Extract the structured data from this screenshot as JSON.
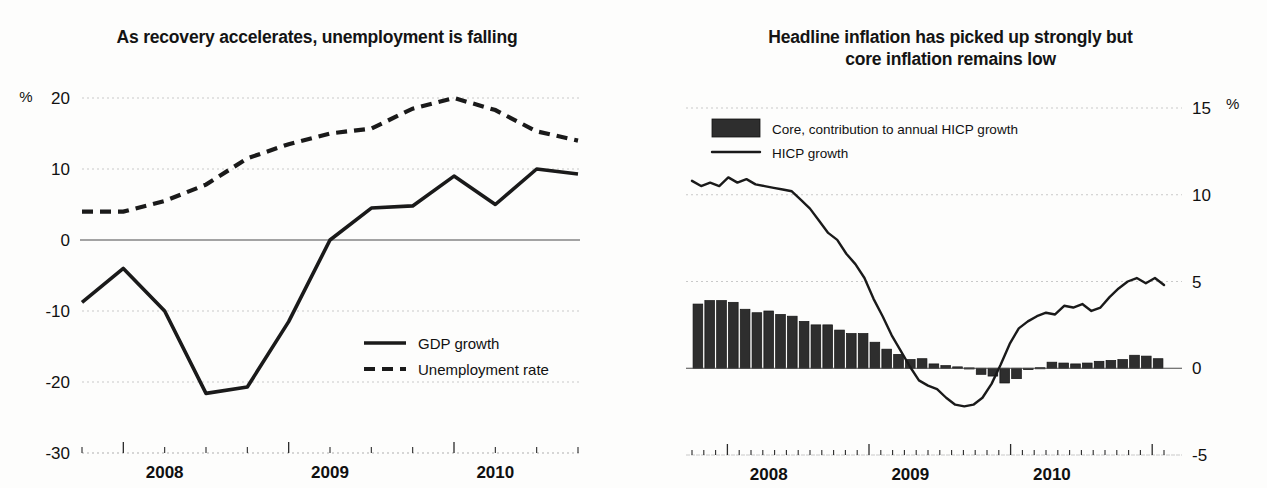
{
  "figure": {
    "background_color": "#fdfdfc",
    "ink_color": "#1a1a1a",
    "bar_color": "#2e2e2e",
    "grid_color": "#c9c9c9"
  },
  "chart_data": [
    {
      "id": "left",
      "type": "line",
      "title": "As recovery accelerates, unemployment is falling",
      "xlabel": "",
      "ylabel": "",
      "unit_label": "%",
      "unit_label_position": "top-left",
      "grid": true,
      "legend_position": "inside-right-lower",
      "ylim": [
        -30,
        20
      ],
      "yticks": [
        20,
        10,
        0,
        -10,
        -20,
        -30
      ],
      "ytick_labels": [
        "20",
        "10",
        "0",
        "-10",
        "-20",
        "-30"
      ],
      "x": [
        "2007Q4",
        "2008Q1",
        "2008Q2",
        "2008Q3",
        "2008Q4",
        "2009Q1",
        "2009Q2",
        "2009Q3",
        "2009Q4",
        "2010Q1",
        "2010Q2",
        "2010Q3",
        "2010Q4"
      ],
      "xtick_labels": [
        "2008",
        "2009",
        "2010"
      ],
      "xtick_label_positions": [
        2,
        6,
        10
      ],
      "series": [
        {
          "name": "GDP growth",
          "style": "solid",
          "values": [
            -8.8,
            -4.0,
            -10.0,
            -21.6,
            -20.7,
            -11.5,
            0.0,
            4.5,
            4.8,
            9.0,
            5.0,
            10.0,
            9.3
          ]
        },
        {
          "name": "Unemployment rate",
          "style": "dashed",
          "values": [
            4.0,
            4.0,
            5.5,
            7.8,
            11.5,
            13.5,
            15.0,
            15.7,
            18.5,
            20.0,
            18.3,
            15.3,
            14.0
          ]
        }
      ]
    },
    {
      "id": "right",
      "type": "bar+line",
      "title": "Headline inflation has picked up strongly but core inflation remains low",
      "xlabel": "",
      "ylabel": "",
      "unit_label": "%",
      "unit_label_position": "top-right",
      "grid": true,
      "y_axis_side": "right",
      "legend_position": "inside-top-left",
      "ylim": [
        -5,
        15
      ],
      "yticks": [
        15,
        10,
        5,
        0,
        -5
      ],
      "ytick_labels": [
        "15",
        "10",
        "5",
        "0",
        "-5"
      ],
      "xtick_labels": [
        "2008",
        "2009",
        "2010"
      ],
      "xtick_label_positions": [
        6,
        18,
        30
      ],
      "x": [
        "2007-10",
        "2007-11",
        "2007-12",
        "2008-01",
        "2008-02",
        "2008-03",
        "2008-04",
        "2008-05",
        "2008-06",
        "2008-07",
        "2008-08",
        "2008-09",
        "2008-10",
        "2008-11",
        "2008-12",
        "2009-01",
        "2009-02",
        "2009-03",
        "2009-04",
        "2009-05",
        "2009-06",
        "2009-07",
        "2009-08",
        "2009-09",
        "2009-10",
        "2009-11",
        "2009-12",
        "2010-01",
        "2010-02",
        "2010-03",
        "2010-04",
        "2010-05",
        "2010-06",
        "2010-07",
        "2010-08",
        "2010-09",
        "2010-10",
        "2010-11",
        "2010-12"
      ],
      "series": [
        {
          "name": "Core, contribution to annual HICP growth",
          "style": "bar",
          "values": [
            3.7,
            3.9,
            3.9,
            3.8,
            3.4,
            3.2,
            3.3,
            3.1,
            3.0,
            2.7,
            2.5,
            2.5,
            2.2,
            2.0,
            2.0,
            1.5,
            1.1,
            0.8,
            0.5,
            0.55,
            0.25,
            0.15,
            0.08,
            0.02,
            -0.35,
            -0.45,
            -0.85,
            -0.6,
            -0.08,
            0.03,
            0.35,
            0.3,
            0.25,
            0.3,
            0.4,
            0.45,
            0.5,
            0.75,
            0.7,
            0.55
          ]
        },
        {
          "name": "HICP growth",
          "style": "line",
          "values": [
            10.8,
            10.5,
            10.7,
            10.5,
            11.0,
            10.7,
            10.9,
            10.6,
            10.5,
            10.4,
            10.3,
            10.2,
            9.7,
            9.2,
            8.5,
            7.8,
            7.4,
            6.6,
            6.0,
            5.2,
            4.0,
            3.0,
            1.9,
            1.0,
            0.1,
            -0.7,
            -1.0,
            -1.2,
            -1.7,
            -2.1,
            -2.2,
            -2.1,
            -1.7,
            -0.9,
            0.2,
            1.4,
            2.3,
            2.7,
            3.0,
            3.2,
            3.1,
            3.6,
            3.5,
            3.7,
            3.3,
            3.5,
            4.1,
            4.6,
            5.0,
            5.2,
            4.9,
            5.2,
            4.8
          ]
        }
      ]
    }
  ]
}
